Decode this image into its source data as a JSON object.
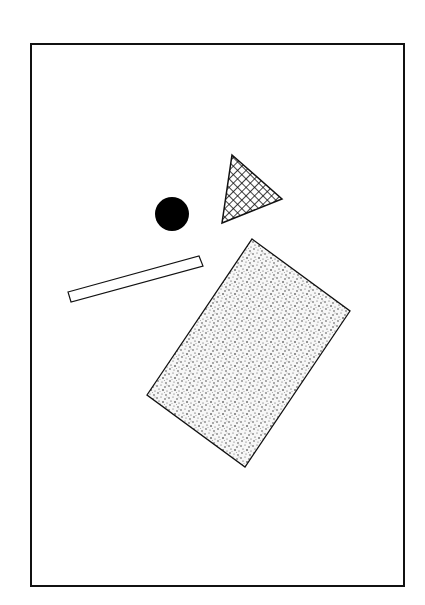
{
  "figure": {
    "background": "#ffffff",
    "stroke_color": "#111111",
    "frame": {
      "x": 31,
      "y": 44,
      "width": 373,
      "height": 542,
      "stroke_width": 2
    },
    "shapes": [
      {
        "id": "circle",
        "kind": "circle",
        "fill": "solid-black",
        "cx": 172,
        "cy": 214,
        "r": 17
      },
      {
        "id": "triangle",
        "kind": "triangle",
        "fill": "crosshatch",
        "points": [
          [
            232,
            155
          ],
          [
            282,
            199
          ],
          [
            222,
            223
          ]
        ]
      },
      {
        "id": "thin-bar",
        "kind": "rectangle",
        "fill": "white",
        "points": [
          [
            68,
            292
          ],
          [
            199,
            256
          ],
          [
            203,
            266
          ],
          [
            71,
            302
          ]
        ]
      },
      {
        "id": "stippled-rectangle",
        "kind": "rectangle",
        "fill": "stipple",
        "points": [
          [
            252,
            239
          ],
          [
            350,
            311
          ],
          [
            245,
            467
          ],
          [
            147,
            395
          ]
        ]
      }
    ]
  }
}
